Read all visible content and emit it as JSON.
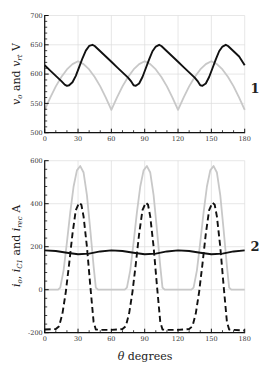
{
  "chart_data": [
    {
      "type": "line",
      "panel_label": "1",
      "title": "",
      "xlabel": "",
      "ylabel": "v_o and v_rt V",
      "ylabel_parts": {
        "v1": "v",
        "s1": "o",
        "mid": " and ",
        "v2": "v",
        "s2": "rt",
        "unit": " V"
      },
      "xlim": [
        0,
        180
      ],
      "ylim": [
        500,
        700
      ],
      "xticks": [
        0,
        30,
        60,
        90,
        120,
        150,
        180
      ],
      "yticks": [
        500,
        550,
        600,
        650,
        700
      ],
      "grid": true,
      "series": [
        {
          "name": "v_rt (rectified)",
          "color": "#c8c8c8",
          "style": "solid",
          "x": [
            0,
            5,
            10,
            15,
            20,
            25,
            30,
            35,
            40,
            45,
            50,
            55,
            60,
            65,
            70,
            75,
            80,
            85,
            90,
            95,
            100,
            105,
            110,
            115,
            120,
            125,
            130,
            135,
            140,
            145,
            150,
            155,
            160,
            165,
            170,
            175,
            180
          ],
          "values": [
            539,
            560,
            579,
            595,
            608,
            617,
            622,
            617,
            608,
            595,
            579,
            560,
            539,
            560,
            579,
            595,
            608,
            617,
            622,
            617,
            608,
            595,
            579,
            560,
            539,
            560,
            579,
            595,
            608,
            617,
            622,
            617,
            608,
            595,
            579,
            560,
            539
          ]
        },
        {
          "name": "v_o",
          "color": "#111111",
          "style": "solid",
          "x": [
            0,
            5,
            10,
            15,
            18,
            20,
            22,
            25,
            28,
            31,
            34,
            37,
            40,
            43,
            45,
            50,
            55,
            60,
            65,
            70,
            75,
            78,
            80,
            82,
            85,
            88,
            91,
            94,
            97,
            100,
            103,
            105,
            110,
            115,
            120,
            125,
            130,
            135,
            138,
            140,
            142,
            145,
            148,
            151,
            154,
            157,
            160,
            163,
            165,
            170,
            175,
            180
          ],
          "values": [
            615,
            606,
            597,
            588,
            582,
            580,
            581,
            586,
            597,
            612,
            627,
            640,
            648,
            650,
            648,
            639,
            630,
            621,
            612,
            603,
            594,
            587,
            581,
            580,
            584,
            595,
            610,
            625,
            639,
            647,
            650,
            648,
            639,
            630,
            621,
            612,
            603,
            594,
            587,
            581,
            580,
            584,
            595,
            610,
            625,
            639,
            647,
            650,
            648,
            639,
            630,
            615
          ]
        }
      ]
    },
    {
      "type": "line",
      "panel_label": "2",
      "title": "",
      "xlabel": "θ degrees",
      "xlabel_parts": {
        "theta": "θ",
        "rest": " degrees"
      },
      "ylabel": "i_o, i_C1 and i_rec A",
      "ylabel_parts": {
        "v1": "i",
        "s1": "o",
        "sep": ", ",
        "v2": "i",
        "s2": "C1",
        "mid": " and ",
        "v3": "i",
        "s3": "rec",
        "unit": " A"
      },
      "xlim": [
        0,
        180
      ],
      "ylim": [
        -200,
        600
      ],
      "xticks": [
        0,
        30,
        60,
        90,
        120,
        150,
        180
      ],
      "yticks": [
        -200,
        0,
        200,
        400,
        600
      ],
      "grid": true,
      "series": [
        {
          "name": "i_rec",
          "color": "#c8c8c8",
          "style": "solid",
          "x": [
            0,
            12,
            14,
            17,
            20,
            23,
            26,
            29,
            32,
            35,
            38,
            41,
            44,
            46,
            48,
            60,
            72,
            74,
            77,
            80,
            83,
            86,
            89,
            92,
            95,
            98,
            101,
            104,
            106,
            108,
            120,
            132,
            134,
            137,
            140,
            143,
            146,
            149,
            152,
            155,
            158,
            161,
            164,
            166,
            168,
            180
          ],
          "values": [
            0,
            0,
            10,
            90,
            220,
            360,
            480,
            555,
            575,
            545,
            440,
            280,
            110,
            10,
            0,
            0,
            0,
            10,
            90,
            220,
            360,
            480,
            555,
            575,
            545,
            440,
            280,
            110,
            10,
            0,
            0,
            0,
            10,
            90,
            220,
            360,
            480,
            555,
            575,
            545,
            440,
            280,
            110,
            10,
            0,
            0
          ]
        },
        {
          "name": "i_C1",
          "color": "#111111",
          "style": "dashed",
          "x": [
            0,
            10,
            13,
            16,
            19,
            22,
            25,
            28,
            31,
            33,
            35,
            38,
            41,
            44,
            46,
            50,
            60,
            70,
            73,
            76,
            79,
            82,
            85,
            88,
            91,
            93,
            95,
            98,
            101,
            104,
            106,
            110,
            120,
            130,
            133,
            136,
            139,
            142,
            145,
            148,
            151,
            153,
            155,
            158,
            161,
            164,
            166,
            170,
            180
          ],
          "values": [
            -185,
            -183,
            -170,
            -110,
            -10,
            120,
            260,
            370,
            405,
            395,
            340,
            200,
            20,
            -150,
            -185,
            -187,
            -187,
            -183,
            -170,
            -110,
            -10,
            120,
            260,
            370,
            405,
            395,
            340,
            200,
            20,
            -150,
            -185,
            -187,
            -187,
            -183,
            -170,
            -110,
            -10,
            120,
            260,
            370,
            405,
            395,
            340,
            200,
            20,
            -150,
            -185,
            -187,
            -190
          ]
        },
        {
          "name": "i_o",
          "color": "#111111",
          "style": "solid",
          "x": [
            0,
            10,
            20,
            30,
            40,
            50,
            60,
            70,
            80,
            90,
            100,
            110,
            120,
            130,
            140,
            150,
            160,
            170,
            180
          ],
          "values": [
            183,
            180,
            172,
            165,
            168,
            178,
            183,
            180,
            172,
            165,
            168,
            178,
            183,
            180,
            172,
            165,
            168,
            178,
            183
          ]
        }
      ]
    }
  ]
}
